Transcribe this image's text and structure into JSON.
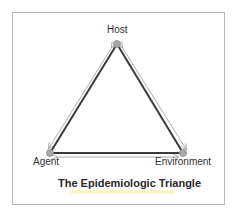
{
  "diagram": {
    "title": "The Epidemiologic Triangle",
    "nodes": [
      {
        "id": "host",
        "label": "Host",
        "x": 117,
        "y": 44
      },
      {
        "id": "agent",
        "label": "Agent",
        "x": 50,
        "y": 153
      },
      {
        "id": "environment",
        "label": "Environment",
        "x": 183,
        "y": 153
      }
    ],
    "edges": [
      {
        "from": "host",
        "to": "agent",
        "bidirectional": true
      },
      {
        "from": "host",
        "to": "environment",
        "bidirectional": true
      },
      {
        "from": "agent",
        "to": "environment",
        "bidirectional": true
      }
    ],
    "colors": {
      "edge": "#3a3a3a",
      "arrow": "#9a9a9a",
      "node_fill": "#a8a8a8",
      "node_stroke": "#8a8a8a",
      "frame": "#b8b8b8",
      "title_highlight": "#fbf6c8"
    }
  }
}
